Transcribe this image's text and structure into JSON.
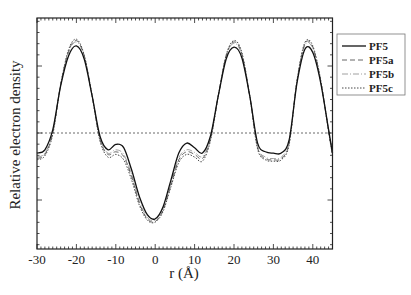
{
  "chart_data": {
    "type": "line",
    "title": "",
    "xlabel": "r (Å)",
    "ylabel": "Relative electron density",
    "xlim": [
      -30,
      45
    ],
    "ylim": [
      -1.73,
      1.72
    ],
    "xticks": [
      -30,
      -20,
      -10,
      0,
      10,
      20,
      30,
      40
    ],
    "yticks_labeled": false,
    "zero_reference_line": {
      "y": 0,
      "style": "dotted"
    },
    "grid": false,
    "legend_position": "outside-right-top",
    "x": [
      -30,
      -28,
      -26,
      -24,
      -22,
      -20,
      -18,
      -16,
      -14,
      -12,
      -10,
      -8,
      -6,
      -4,
      -2,
      0,
      2,
      4,
      6,
      8,
      10,
      12,
      14,
      16,
      18,
      20,
      22,
      24,
      26,
      28,
      30,
      32,
      34,
      36,
      38,
      40,
      42,
      44,
      45
    ],
    "series": [
      {
        "name": "PF5",
        "style": "solid",
        "color": "#111111",
        "values": [
          -0.3,
          -0.25,
          0.05,
          0.7,
          1.15,
          1.3,
          1.1,
          0.55,
          -0.05,
          -0.25,
          -0.17,
          -0.22,
          -0.55,
          -0.95,
          -1.22,
          -1.28,
          -1.1,
          -0.7,
          -0.3,
          -0.15,
          -0.22,
          -0.3,
          -0.05,
          0.55,
          1.1,
          1.28,
          1.12,
          0.55,
          -0.15,
          -0.28,
          -0.3,
          -0.3,
          -0.1,
          0.75,
          1.25,
          1.2,
          0.75,
          0.05,
          -0.3
        ]
      },
      {
        "name": "PF5a",
        "style": "dashed",
        "color": "#555555",
        "values": [
          -0.38,
          -0.32,
          0.0,
          0.72,
          1.22,
          1.38,
          1.15,
          0.55,
          -0.1,
          -0.32,
          -0.28,
          -0.35,
          -0.65,
          -1.05,
          -1.28,
          -1.32,
          -1.15,
          -0.78,
          -0.4,
          -0.28,
          -0.32,
          -0.38,
          -0.1,
          0.55,
          1.15,
          1.36,
          1.18,
          0.55,
          -0.22,
          -0.38,
          -0.4,
          -0.38,
          -0.15,
          0.78,
          1.33,
          1.28,
          0.78,
          0.03,
          -0.32
        ]
      },
      {
        "name": "PF5b",
        "style": "dash-dot",
        "color": "#888888",
        "values": [
          -0.36,
          -0.3,
          0.02,
          0.72,
          1.2,
          1.36,
          1.14,
          0.55,
          -0.08,
          -0.3,
          -0.25,
          -0.32,
          -0.62,
          -1.02,
          -1.26,
          -1.3,
          -1.12,
          -0.75,
          -0.37,
          -0.25,
          -0.29,
          -0.35,
          -0.08,
          0.55,
          1.14,
          1.34,
          1.16,
          0.55,
          -0.2,
          -0.36,
          -0.38,
          -0.36,
          -0.13,
          0.77,
          1.31,
          1.26,
          0.77,
          0.04,
          -0.31
        ]
      },
      {
        "name": "PF5c",
        "style": "dotted",
        "color": "#333333",
        "values": [
          -0.4,
          -0.34,
          -0.02,
          0.72,
          1.24,
          1.4,
          1.16,
          0.55,
          -0.12,
          -0.36,
          -0.32,
          -0.4,
          -0.7,
          -1.08,
          -1.3,
          -1.33,
          -1.17,
          -0.8,
          -0.44,
          -0.32,
          -0.36,
          -0.42,
          -0.12,
          0.55,
          1.16,
          1.38,
          1.2,
          0.55,
          -0.24,
          -0.4,
          -0.42,
          -0.4,
          -0.17,
          0.79,
          1.35,
          1.3,
          0.79,
          0.02,
          -0.33
        ]
      }
    ]
  },
  "legend": {
    "items": [
      {
        "label": "PF5",
        "style": "solid"
      },
      {
        "label": "PF5a",
        "style": "dashed"
      },
      {
        "label": "PF5b",
        "style": "dash-dot"
      },
      {
        "label": "PF5c",
        "style": "dotted"
      }
    ]
  },
  "axes": {
    "x_title": "r (Å)",
    "y_title": "Relative electron density",
    "x_tick_labels": [
      "-30",
      "-20",
      "-10",
      "0",
      "10",
      "20",
      "30",
      "40"
    ]
  }
}
